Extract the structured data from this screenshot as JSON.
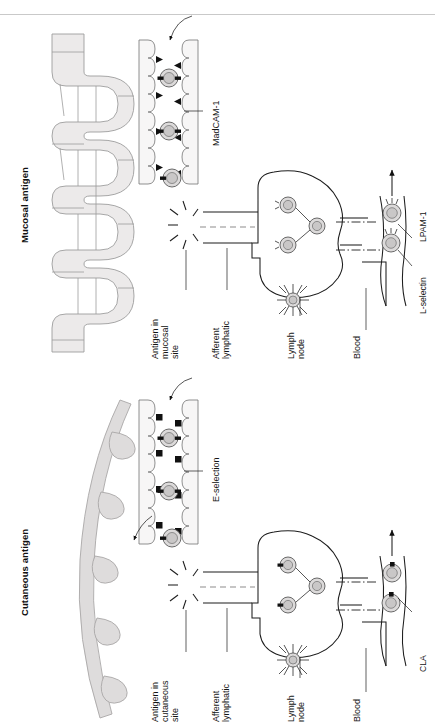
{
  "figure": {
    "type": "diagram",
    "orientation": "rotated-90-ccw"
  },
  "panels": [
    {
      "id": "mucosal",
      "title": "Mucosal antigen",
      "tissue_icon": "intestine-coiled",
      "adhesion_molecule": "MadCAM-1",
      "labels": {
        "antigen": "Antigen in\nmucosal\nsite",
        "lymphatic": "Afferent\nlymphatic",
        "node": "Lymph\nnode",
        "blood": "Blood"
      },
      "homing_receptors": [
        "L-selectin",
        "LPAM-1"
      ]
    },
    {
      "id": "cutaneous",
      "title": "Cutaneous antigen",
      "tissue_icon": "skin-hair-follicles",
      "adhesion_molecule": "E-selection",
      "labels": {
        "antigen": "Antigen in\ncutaneous\nsite",
        "lymphatic": "Afferent\nlymphatic",
        "node": "Lymph\nnode",
        "blood": "Blood"
      },
      "homing_receptors": [
        "CLA"
      ]
    }
  ],
  "colors": {
    "ink": "#1a1a1a",
    "tissue_fill": "#eceaea",
    "tissue_stroke": "#9d9d9d",
    "skin_fill": "#dedcdc",
    "cell_fill": "#dcdada",
    "rule": "#c9c9c9"
  }
}
